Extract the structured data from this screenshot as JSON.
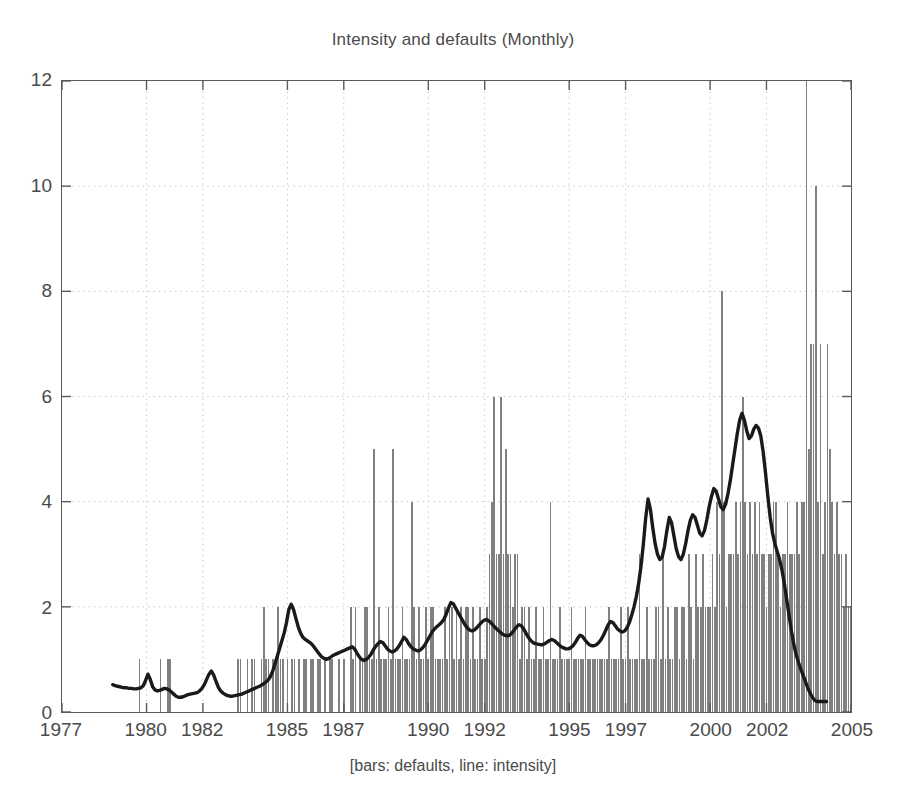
{
  "chart_data": {
    "type": "bar",
    "title": "Intensity and defaults (Monthly)",
    "xlabel": "[bars: defaults, line: intensity]",
    "ylabel": "",
    "xlim": [
      1977,
      2005
    ],
    "ylim": [
      0,
      12
    ],
    "yticks": [
      0,
      2,
      4,
      6,
      8,
      10,
      12
    ],
    "xticks": [
      1977,
      1980,
      1982,
      1985,
      1987,
      1990,
      1992,
      1995,
      1997,
      2000,
      2002,
      2005
    ],
    "xtick_labels": [
      "1977",
      "1980",
      "1982",
      "1985",
      "1987",
      "1990",
      "1992",
      "1995",
      "1997",
      "2000",
      "2002",
      "2005"
    ],
    "ytick_labels": [
      "0",
      "2",
      "4",
      "6",
      "8",
      "10",
      "12"
    ],
    "grid": true,
    "grid_style": "dotted",
    "legend": "none",
    "legend_position": "none",
    "annotation": "bars: defaults, line: intensity",
    "bar_color": "#808080",
    "line_color": "#1a1a1a",
    "axis_color": "#5a5a5a",
    "background": "#ffffff",
    "series": [
      {
        "name": "defaults",
        "type": "bar",
        "x_start": 1977.0,
        "x_step": 0.08333,
        "units": "count per month",
        "values": [
          0,
          0,
          0,
          0,
          0,
          0,
          0,
          0,
          0,
          0,
          0,
          0,
          0,
          0,
          0,
          0,
          0,
          0,
          0,
          0,
          0,
          0,
          0,
          0,
          0,
          0,
          0,
          0,
          0,
          0,
          0,
          0,
          0,
          1,
          0,
          0,
          0,
          0,
          0,
          0,
          0,
          0,
          1,
          0,
          0,
          1,
          1,
          0,
          0,
          0,
          0,
          0,
          0,
          0,
          0,
          0,
          0,
          0,
          0,
          0,
          0,
          0,
          0,
          0,
          0,
          0,
          0,
          0,
          0,
          0,
          0,
          0,
          0,
          0,
          0,
          1,
          1,
          0,
          0,
          1,
          0,
          1,
          1,
          0,
          0,
          1,
          2,
          1,
          1,
          0,
          1,
          1,
          2,
          1,
          1,
          0,
          1,
          0,
          1,
          1,
          0,
          1,
          0,
          1,
          1,
          0,
          1,
          1,
          0,
          1,
          1,
          0,
          1,
          0,
          1,
          1,
          0,
          0,
          1,
          0,
          1,
          0,
          0,
          2,
          1,
          2,
          0,
          1,
          1,
          2,
          2,
          1,
          1,
          5,
          1,
          2,
          1,
          1,
          1,
          2,
          1,
          5,
          1,
          1,
          1,
          2,
          1,
          1,
          1,
          4,
          2,
          1,
          2,
          1,
          1,
          2,
          1,
          2,
          2,
          1,
          1,
          1,
          1,
          2,
          1,
          2,
          2,
          1,
          2,
          1,
          2,
          1,
          2,
          2,
          1,
          2,
          1,
          1,
          2,
          1,
          1,
          2,
          3,
          4,
          6,
          3,
          3,
          6,
          3,
          5,
          3,
          3,
          2,
          3,
          3,
          1,
          2,
          2,
          1,
          2,
          1,
          1,
          2,
          1,
          1,
          2,
          1,
          1,
          4,
          1,
          1,
          1,
          2,
          1,
          1,
          1,
          1,
          2,
          1,
          1,
          1,
          1,
          1,
          2,
          1,
          1,
          1,
          1,
          1,
          1,
          1,
          1,
          1,
          2,
          1,
          1,
          1,
          1,
          2,
          1,
          1,
          2,
          1,
          1,
          1,
          1,
          3,
          1,
          1,
          2,
          1,
          1,
          1,
          2,
          2,
          1,
          3,
          1,
          2,
          1,
          1,
          2,
          2,
          1,
          2,
          2,
          1,
          3,
          2,
          1,
          3,
          2,
          2,
          3,
          2,
          2,
          2,
          3,
          2,
          4,
          3,
          8,
          4,
          2,
          3,
          3,
          3,
          4,
          3,
          4,
          6,
          4,
          3,
          4,
          3,
          4,
          3,
          4,
          3,
          3,
          2,
          3,
          3,
          4,
          4,
          3,
          2,
          3,
          3,
          4,
          3,
          3,
          3,
          4,
          3,
          4,
          4,
          12,
          5,
          7,
          7,
          10,
          4,
          7,
          3,
          4,
          7,
          5,
          4,
          3,
          4,
          3,
          3,
          2,
          3,
          2,
          2,
          2,
          2,
          2,
          1,
          1,
          1,
          1,
          1,
          1,
          2,
          2,
          0,
          0,
          0,
          0,
          0,
          0,
          0,
          0,
          0,
          0,
          0,
          0
        ]
      },
      {
        "name": "intensity",
        "type": "line",
        "x_start": 1978.8,
        "x_step": 0.08333,
        "units": "intensity",
        "values": [
          0.52,
          0.5,
          0.49,
          0.48,
          0.47,
          0.46,
          0.46,
          0.45,
          0.45,
          0.44,
          0.44,
          0.45,
          0.46,
          0.5,
          0.6,
          0.72,
          0.62,
          0.48,
          0.42,
          0.4,
          0.41,
          0.43,
          0.45,
          0.44,
          0.42,
          0.38,
          0.34,
          0.3,
          0.28,
          0.28,
          0.29,
          0.31,
          0.33,
          0.34,
          0.35,
          0.36,
          0.37,
          0.4,
          0.45,
          0.52,
          0.62,
          0.72,
          0.78,
          0.7,
          0.58,
          0.47,
          0.4,
          0.36,
          0.33,
          0.31,
          0.3,
          0.3,
          0.31,
          0.32,
          0.33,
          0.34,
          0.36,
          0.38,
          0.4,
          0.42,
          0.44,
          0.46,
          0.48,
          0.5,
          0.53,
          0.56,
          0.6,
          0.66,
          0.76,
          0.9,
          1.05,
          1.2,
          1.35,
          1.5,
          1.7,
          1.95,
          2.05,
          1.95,
          1.78,
          1.62,
          1.5,
          1.42,
          1.38,
          1.35,
          1.32,
          1.28,
          1.22,
          1.16,
          1.1,
          1.05,
          1.02,
          1.0,
          1.02,
          1.05,
          1.08,
          1.1,
          1.12,
          1.14,
          1.16,
          1.18,
          1.2,
          1.22,
          1.24,
          1.2,
          1.12,
          1.05,
          1.0,
          0.98,
          1.0,
          1.04,
          1.1,
          1.18,
          1.25,
          1.3,
          1.34,
          1.32,
          1.26,
          1.2,
          1.16,
          1.14,
          1.16,
          1.2,
          1.26,
          1.34,
          1.42,
          1.38,
          1.3,
          1.24,
          1.2,
          1.18,
          1.16,
          1.18,
          1.22,
          1.28,
          1.36,
          1.44,
          1.52,
          1.58,
          1.62,
          1.66,
          1.7,
          1.76,
          1.86,
          1.98,
          2.08,
          2.06,
          1.98,
          1.9,
          1.82,
          1.74,
          1.66,
          1.6,
          1.56,
          1.54,
          1.56,
          1.6,
          1.65,
          1.7,
          1.74,
          1.76,
          1.74,
          1.7,
          1.65,
          1.6,
          1.56,
          1.52,
          1.48,
          1.46,
          1.45,
          1.46,
          1.5,
          1.56,
          1.62,
          1.66,
          1.64,
          1.58,
          1.5,
          1.42,
          1.36,
          1.32,
          1.3,
          1.29,
          1.28,
          1.28,
          1.3,
          1.33,
          1.36,
          1.38,
          1.36,
          1.32,
          1.28,
          1.24,
          1.22,
          1.2,
          1.2,
          1.22,
          1.26,
          1.32,
          1.4,
          1.46,
          1.44,
          1.38,
          1.32,
          1.28,
          1.26,
          1.26,
          1.28,
          1.32,
          1.38,
          1.46,
          1.56,
          1.66,
          1.72,
          1.7,
          1.64,
          1.58,
          1.54,
          1.52,
          1.54,
          1.6,
          1.7,
          1.84,
          2.0,
          2.2,
          2.45,
          2.78,
          3.2,
          3.7,
          4.05,
          3.85,
          3.5,
          3.2,
          3.0,
          2.9,
          2.95,
          3.15,
          3.45,
          3.7,
          3.6,
          3.35,
          3.1,
          2.95,
          2.9,
          3.0,
          3.2,
          3.45,
          3.65,
          3.75,
          3.7,
          3.55,
          3.4,
          3.35,
          3.45,
          3.65,
          3.9,
          4.1,
          4.25,
          4.2,
          4.05,
          3.9,
          3.85,
          3.95,
          4.15,
          4.4,
          4.7,
          5.0,
          5.3,
          5.55,
          5.68,
          5.55,
          5.35,
          5.2,
          5.25,
          5.38,
          5.45,
          5.4,
          5.25,
          4.95,
          4.55,
          4.1,
          3.7,
          3.4,
          3.2,
          3.05,
          2.9,
          2.7,
          2.45,
          2.15,
          1.85,
          1.55,
          1.3,
          1.1,
          0.95,
          0.82,
          0.7,
          0.58,
          0.46,
          0.36,
          0.28,
          0.22,
          0.2,
          0.2,
          0.2,
          0.2,
          0.2
        ]
      }
    ]
  }
}
